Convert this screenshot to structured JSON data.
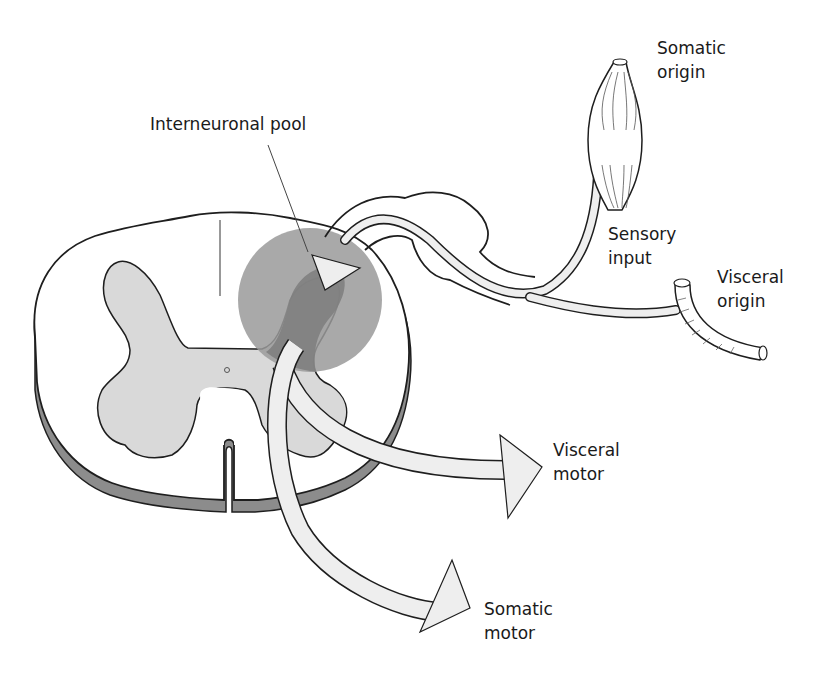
{
  "diagram": {
    "colors": {
      "outline": "#1e1e1e",
      "gray_matter": "#d9d9d9",
      "interneuronal_pool": "#9a9a9a",
      "pool_overlap": "#7f7f7f",
      "pia_rim": "#8c8c8c",
      "arrow_fill": "#eeeeee"
    },
    "labels": {
      "interneuronal_pool": "Interneuronal pool",
      "somatic_origin": {
        "line1": "Somatic",
        "line2": "origin"
      },
      "sensory_input": {
        "line1": "Sensory",
        "line2": "input"
      },
      "visceral_origin": {
        "line1": "Visceral",
        "line2": "origin"
      },
      "visceral_motor": {
        "line1": "Visceral",
        "line2": "motor"
      },
      "somatic_motor": {
        "line1": "Somatic",
        "line2": "motor"
      }
    },
    "nodes": [
      {
        "id": "somatic-origin",
        "shape": "muscle"
      },
      {
        "id": "visceral-origin",
        "shape": "tube"
      },
      {
        "id": "spinal-cord",
        "shape": "cross-section"
      },
      {
        "id": "interneuronal-pool",
        "shape": "circle"
      }
    ],
    "edges": [
      {
        "from": "somatic-origin",
        "to": "interneuronal-pool",
        "label": "Sensory input"
      },
      {
        "from": "visceral-origin",
        "to": "interneuronal-pool",
        "label": "Sensory input"
      },
      {
        "from": "interneuronal-pool",
        "to": "visceral-motor",
        "label": "Visceral motor"
      },
      {
        "from": "interneuronal-pool",
        "to": "somatic-motor",
        "label": "Somatic motor"
      }
    ]
  }
}
